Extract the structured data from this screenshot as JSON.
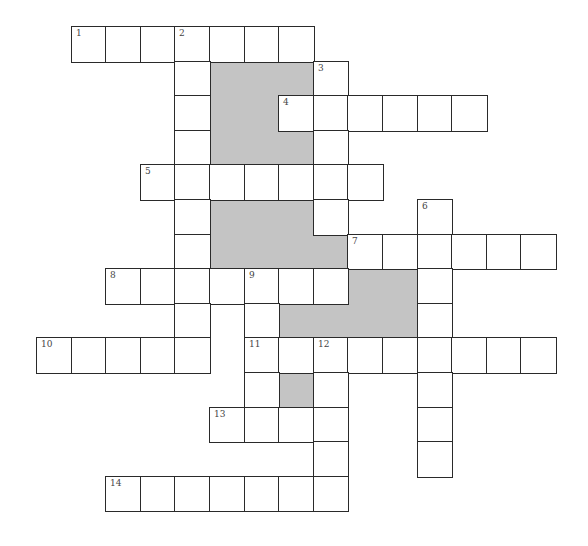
{
  "puzzle": {
    "type": "crossword",
    "grid": {
      "origin_x": 37,
      "origin_y": 27,
      "cell_size": 34.6,
      "shade_color": "#c4c4c4",
      "border_color": "#2a2a2a"
    },
    "cells": [
      {
        "r": 0,
        "c": 1,
        "n": "1"
      },
      {
        "r": 0,
        "c": 2
      },
      {
        "r": 0,
        "c": 3
      },
      {
        "r": 0,
        "c": 4,
        "n": "2"
      },
      {
        "r": 0,
        "c": 5
      },
      {
        "r": 0,
        "c": 6
      },
      {
        "r": 0,
        "c": 7
      },
      {
        "r": 1,
        "c": 4
      },
      {
        "r": 1,
        "c": 8,
        "n": "3"
      },
      {
        "r": 2,
        "c": 4
      },
      {
        "r": 2,
        "c": 7,
        "n": "4"
      },
      {
        "r": 2,
        "c": 8
      },
      {
        "r": 2,
        "c": 9
      },
      {
        "r": 2,
        "c": 10
      },
      {
        "r": 2,
        "c": 11
      },
      {
        "r": 2,
        "c": 12
      },
      {
        "r": 3,
        "c": 4
      },
      {
        "r": 3,
        "c": 8
      },
      {
        "r": 4,
        "c": 3,
        "n": "5"
      },
      {
        "r": 4,
        "c": 4
      },
      {
        "r": 4,
        "c": 5
      },
      {
        "r": 4,
        "c": 6
      },
      {
        "r": 4,
        "c": 7
      },
      {
        "r": 4,
        "c": 8
      },
      {
        "r": 4,
        "c": 9
      },
      {
        "r": 5,
        "c": 4
      },
      {
        "r": 5,
        "c": 8
      },
      {
        "r": 5,
        "c": 11,
        "n": "6"
      },
      {
        "r": 6,
        "c": 4
      },
      {
        "r": 6,
        "c": 9,
        "n": "7"
      },
      {
        "r": 6,
        "c": 10
      },
      {
        "r": 6,
        "c": 11
      },
      {
        "r": 6,
        "c": 12
      },
      {
        "r": 6,
        "c": 13
      },
      {
        "r": 6,
        "c": 14
      },
      {
        "r": 7,
        "c": 2,
        "n": "8"
      },
      {
        "r": 7,
        "c": 3
      },
      {
        "r": 7,
        "c": 4
      },
      {
        "r": 7,
        "c": 5
      },
      {
        "r": 7,
        "c": 6,
        "n": "9"
      },
      {
        "r": 7,
        "c": 7
      },
      {
        "r": 7,
        "c": 8
      },
      {
        "r": 7,
        "c": 11
      },
      {
        "r": 8,
        "c": 4
      },
      {
        "r": 8,
        "c": 6
      },
      {
        "r": 8,
        "c": 11
      },
      {
        "r": 9,
        "c": 0,
        "n": "10"
      },
      {
        "r": 9,
        "c": 1
      },
      {
        "r": 9,
        "c": 2
      },
      {
        "r": 9,
        "c": 3
      },
      {
        "r": 9,
        "c": 4
      },
      {
        "r": 9,
        "c": 6,
        "n": "11"
      },
      {
        "r": 9,
        "c": 7
      },
      {
        "r": 9,
        "c": 8,
        "n": "12"
      },
      {
        "r": 9,
        "c": 9
      },
      {
        "r": 9,
        "c": 10
      },
      {
        "r": 9,
        "c": 11
      },
      {
        "r": 9,
        "c": 12
      },
      {
        "r": 9,
        "c": 13
      },
      {
        "r": 9,
        "c": 14
      },
      {
        "r": 10,
        "c": 6
      },
      {
        "r": 10,
        "c": 8
      },
      {
        "r": 10,
        "c": 11
      },
      {
        "r": 11,
        "c": 5,
        "n": "13"
      },
      {
        "r": 11,
        "c": 6
      },
      {
        "r": 11,
        "c": 7
      },
      {
        "r": 11,
        "c": 8
      },
      {
        "r": 11,
        "c": 11
      },
      {
        "r": 12,
        "c": 8
      },
      {
        "r": 12,
        "c": 11
      },
      {
        "r": 13,
        "c": 2,
        "n": "14"
      },
      {
        "r": 13,
        "c": 3
      },
      {
        "r": 13,
        "c": 4
      },
      {
        "r": 13,
        "c": 5
      },
      {
        "r": 13,
        "c": 6
      },
      {
        "r": 13,
        "c": 7
      },
      {
        "r": 13,
        "c": 8
      }
    ],
    "shaded": [
      {
        "r": 1,
        "c": 5
      },
      {
        "r": 1,
        "c": 6
      },
      {
        "r": 1,
        "c": 7
      },
      {
        "r": 2,
        "c": 5
      },
      {
        "r": 2,
        "c": 6
      },
      {
        "r": 3,
        "c": 5
      },
      {
        "r": 3,
        "c": 6
      },
      {
        "r": 3,
        "c": 7
      },
      {
        "r": 5,
        "c": 5
      },
      {
        "r": 5,
        "c": 6
      },
      {
        "r": 5,
        "c": 7
      },
      {
        "r": 6,
        "c": 5
      },
      {
        "r": 6,
        "c": 6
      },
      {
        "r": 6,
        "c": 7
      },
      {
        "r": 6,
        "c": 8
      },
      {
        "r": 7,
        "c": 9
      },
      {
        "r": 7,
        "c": 10
      },
      {
        "r": 8,
        "c": 7
      },
      {
        "r": 8,
        "c": 8
      },
      {
        "r": 8,
        "c": 9
      },
      {
        "r": 8,
        "c": 10
      },
      {
        "r": 10,
        "c": 7
      }
    ],
    "entries": {
      "across": [
        {
          "number": "1",
          "row": 0,
          "col": 1,
          "length": 7
        },
        {
          "number": "4",
          "row": 2,
          "col": 7,
          "length": 6
        },
        {
          "number": "5",
          "row": 4,
          "col": 3,
          "length": 7
        },
        {
          "number": "7",
          "row": 6,
          "col": 9,
          "length": 6
        },
        {
          "number": "8",
          "row": 7,
          "col": 2,
          "length": 7
        },
        {
          "number": "10",
          "row": 9,
          "col": 0,
          "length": 5
        },
        {
          "number": "11",
          "row": 9,
          "col": 6,
          "length": 9
        },
        {
          "number": "13",
          "row": 11,
          "col": 5,
          "length": 4
        },
        {
          "number": "14",
          "row": 13,
          "col": 2,
          "length": 7
        }
      ],
      "down": [
        {
          "number": "2",
          "row": 0,
          "col": 4,
          "length": 10
        },
        {
          "number": "3",
          "row": 1,
          "col": 8,
          "length": 5
        },
        {
          "number": "6",
          "row": 5,
          "col": 11,
          "length": 8
        },
        {
          "number": "9",
          "row": 7,
          "col": 6,
          "length": 5
        },
        {
          "number": "12",
          "row": 9,
          "col": 8,
          "length": 5
        }
      ]
    }
  }
}
